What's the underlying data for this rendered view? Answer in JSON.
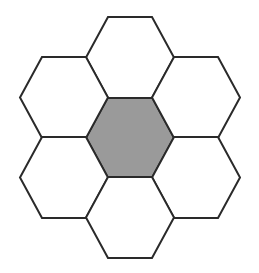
{
  "figure": {
    "background_color": "#ffffff",
    "width": 259,
    "height": 273
  },
  "style": {
    "stroke_color": "#2a2a2a",
    "stroke_width": 2,
    "white_fill": "#ffffff",
    "gray_fill": "#9a9a9a"
  },
  "geometry": {
    "orientation": "flat-top",
    "hex_half_width": 44,
    "hex_half_height": 40.5,
    "hex_side_run": 22,
    "column_step": 66,
    "row_step": 40.5,
    "center_x": 130,
    "center_y": 137.5
  },
  "chart_data": {
    "type": "diagram",
    "cells": [
      {
        "id": "center",
        "label": "center",
        "cx": 130,
        "cy": 137.5,
        "fill": "#9a9a9a",
        "highlighted": "true"
      },
      {
        "id": "top",
        "label": "top",
        "cx": 130,
        "cy": 57.5,
        "fill": "#ffffff",
        "highlighted": "false"
      },
      {
        "id": "upper-left",
        "label": "upper-left",
        "cx": 64,
        "cy": 97.5,
        "fill": "#ffffff",
        "highlighted": "false"
      },
      {
        "id": "upper-right",
        "label": "upper-right",
        "cx": 196,
        "cy": 97.5,
        "fill": "#ffffff",
        "highlighted": "false"
      },
      {
        "id": "lower-left",
        "label": "lower-left",
        "cx": 64,
        "cy": 177.5,
        "fill": "#ffffff",
        "highlighted": "false"
      },
      {
        "id": "lower-right",
        "label": "lower-right",
        "cx": 196,
        "cy": 177.5,
        "fill": "#ffffff",
        "highlighted": "false"
      },
      {
        "id": "bottom",
        "label": "bottom",
        "cx": 130,
        "cy": 217.5,
        "fill": "#ffffff",
        "highlighted": "false"
      }
    ],
    "counts": {
      "total_cells": 7,
      "white_cells": 6,
      "gray_cells": 1
    },
    "legend": [],
    "annotations": []
  }
}
